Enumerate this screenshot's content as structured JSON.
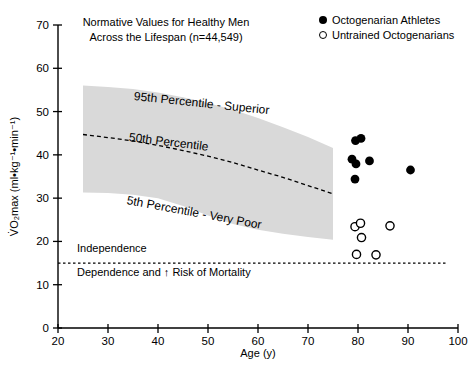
{
  "figure": {
    "title_line1": "Normative Values for Healthy Men",
    "title_line2": "Across the Lifespan (n=44,549)"
  },
  "chart_data": {
    "type": "scatter",
    "title": "Normative Values for Healthy Men Across the Lifespan (n=44,549)",
    "xlabel": "Age (y)",
    "ylabel": "V̇O₂max (ml•kg⁻¹•min⁻¹)",
    "xlim": [
      20,
      100
    ],
    "ylim": [
      0,
      70
    ],
    "x_ticks": [
      20,
      30,
      40,
      50,
      60,
      70,
      80,
      90,
      100
    ],
    "y_ticks": [
      0,
      10,
      20,
      30,
      40,
      50,
      60,
      70
    ],
    "grid": "off",
    "legend_position": "top-right",
    "colors": {
      "band_fill": "#d9d9d9",
      "marker": "#000000",
      "text": "#000000",
      "axis": "#000000"
    },
    "series": [
      {
        "name": "Octogenarian Athletes",
        "marker": "filled-circle",
        "points": [
          [
            79.5,
            43.3
          ],
          [
            80.6,
            43.8
          ],
          [
            78.8,
            39.0
          ],
          [
            79.6,
            37.9
          ],
          [
            82.3,
            38.6
          ],
          [
            79.4,
            34.4
          ],
          [
            90.5,
            36.5
          ]
        ]
      },
      {
        "name": "Untrained Octogenarians",
        "marker": "open-circle",
        "points": [
          [
            79.4,
            23.4
          ],
          [
            80.5,
            24.2
          ],
          [
            86.4,
            23.6
          ],
          [
            80.7,
            20.9
          ],
          [
            79.7,
            17.0
          ],
          [
            83.6,
            16.9
          ]
        ]
      }
    ],
    "percentile_band": {
      "ages": [
        25,
        30,
        35,
        40,
        45,
        50,
        55,
        60,
        65,
        70,
        75
      ],
      "p95": [
        56,
        55.7,
        55.2,
        54.4,
        53.3,
        52,
        50.4,
        48.5,
        46.4,
        44.1,
        41.6
      ],
      "p50": [
        44.7,
        44,
        43.2,
        42.2,
        41,
        39.7,
        38.2,
        36.5,
        34.8,
        32.9,
        31
      ],
      "p5": [
        31.3,
        31.2,
        30.8,
        30,
        28.2,
        26,
        24,
        22.7,
        21.8,
        21,
        20.4
      ],
      "labels": {
        "p95": "95th Percentile - Superior",
        "p50": "50th Percentile",
        "p5": "5th Percentile - Very Poor"
      }
    },
    "reference_line": {
      "y": 15,
      "x_range": [
        20,
        98
      ],
      "style": "dashed",
      "label_above": "Independence",
      "label_below": "Dependence and ↑ Risk of Mortality"
    }
  }
}
